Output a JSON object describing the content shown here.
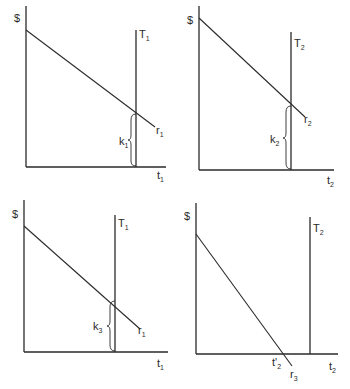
{
  "panels": [
    {
      "id": "top-left",
      "y_axis_label": "$",
      "x_axis_label": "t",
      "x_axis_sub": "1",
      "vertical_line_label": "T",
      "vertical_line_sub": "1",
      "line_label": "r",
      "line_sub": "1",
      "brace_label": "k",
      "brace_sub": "1"
    },
    {
      "id": "top-right",
      "y_axis_label": "$",
      "x_axis_label": "t",
      "x_axis_sub": "2",
      "vertical_line_label": "T",
      "vertical_line_sub": "2",
      "line_label": "r",
      "line_sub": "2",
      "brace_label": "k",
      "brace_sub": "2"
    },
    {
      "id": "bottom-left",
      "y_axis_label": "$",
      "x_axis_label": "t",
      "x_axis_sub": "1",
      "vertical_line_label": "T",
      "vertical_line_sub": "1",
      "line_label": "r",
      "line_sub": "1",
      "brace_label": "k",
      "brace_sub": "3"
    },
    {
      "id": "bottom-right",
      "y_axis_label": "$",
      "x_axis_label": "t",
      "x_axis_sub": "2",
      "vertical_line_label": "T",
      "vertical_line_sub": "2",
      "line_label": "r",
      "line_sub": "3",
      "intercept_label": "t'",
      "intercept_sub": "2"
    }
  ]
}
